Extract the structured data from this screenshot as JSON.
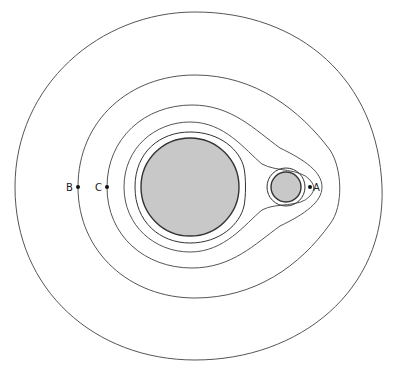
{
  "diagram": {
    "type": "equipotential contours around two bodies",
    "bodies": [
      {
        "name": "large-body",
        "cx": 190,
        "cy": 187,
        "r": 49,
        "fill": "#c8c8c8"
      },
      {
        "name": "small-body",
        "cx": 286,
        "cy": 187,
        "r": 15,
        "fill": "#c8c8c8"
      }
    ],
    "contour_count": 5,
    "points": [
      {
        "label": "A",
        "x": 310,
        "y": 187
      },
      {
        "label": "B",
        "x": 78,
        "y": 187
      },
      {
        "label": "C",
        "x": 107,
        "y": 187
      }
    ]
  },
  "labels": {
    "a": "A",
    "b": "B",
    "c": "C"
  }
}
